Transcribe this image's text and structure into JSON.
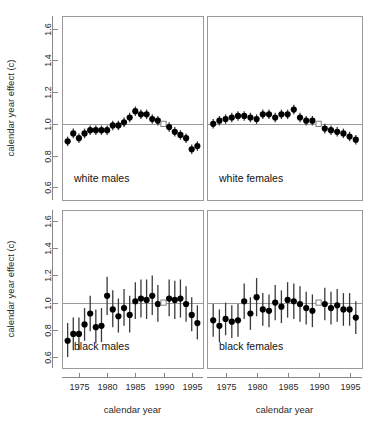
{
  "figure": {
    "title": "",
    "x_axis_title": "calendar year",
    "y_axis_title": "calendar year effect (c)"
  },
  "axes": {
    "x_ticks": [
      "1975",
      "1980",
      "1985",
      "1990",
      "1995"
    ],
    "x_tick_values": [
      1975,
      1980,
      1985,
      1990,
      1995
    ],
    "y_ticks": [
      "0.6",
      "0.8",
      "1.0",
      "1.2",
      "1.4",
      "1.6"
    ],
    "y_tick_values": [
      0.6,
      0.8,
      1.0,
      1.2,
      1.4,
      1.6
    ],
    "xlim": [
      1972.0,
      1997.0
    ],
    "ylim": [
      0.52,
      1.68
    ],
    "reference_value": 1.0,
    "reference_year": 1990
  },
  "chart_data": {
    "type": "scatter",
    "title": "",
    "xlabel": "calendar year",
    "ylabel": "calendar year effect (c)",
    "xlim": [
      1972.0,
      1997.0
    ],
    "ylim": [
      0.52,
      1.68
    ],
    "grid": false,
    "legend": "none",
    "layout": "2x2 panels, shared axes",
    "marker": "filled circle with vertical 95% confidence interval bars; open square marks the reference year (1990, c = 1.00)",
    "annotations": [
      "horizontal reference line drawn at c = 1.0 in every panel",
      "panel name printed inside lower-left of each panel"
    ],
    "panels": [
      {
        "name": "white males",
        "row": 0,
        "col": 0,
        "x": [
          1973,
          1974,
          1975,
          1976,
          1977,
          1978,
          1979,
          1980,
          1981,
          1982,
          1983,
          1984,
          1985,
          1986,
          1987,
          1988,
          1989,
          1990,
          1991,
          1992,
          1993,
          1994,
          1995,
          1996
        ],
        "y": [
          0.89,
          0.94,
          0.91,
          0.94,
          0.96,
          0.96,
          0.96,
          0.96,
          0.99,
          0.99,
          1.01,
          1.04,
          1.08,
          1.06,
          1.06,
          1.03,
          1.02,
          1.0,
          0.98,
          0.95,
          0.93,
          0.91,
          0.84,
          0.86
        ],
        "y_lower": [
          0.86,
          0.91,
          0.88,
          0.91,
          0.93,
          0.93,
          0.93,
          0.93,
          0.96,
          0.96,
          0.98,
          1.01,
          1.05,
          1.03,
          1.03,
          1.0,
          0.99,
          1.0,
          0.95,
          0.92,
          0.9,
          0.88,
          0.81,
          0.83
        ],
        "y_upper": [
          0.92,
          0.97,
          0.94,
          0.97,
          0.99,
          0.99,
          0.99,
          0.99,
          1.02,
          1.02,
          1.04,
          1.07,
          1.11,
          1.09,
          1.09,
          1.06,
          1.05,
          1.0,
          1.01,
          0.98,
          0.96,
          0.94,
          0.87,
          0.89
        ]
      },
      {
        "name": "white females",
        "row": 0,
        "col": 1,
        "x": [
          1973,
          1974,
          1975,
          1976,
          1977,
          1978,
          1979,
          1980,
          1981,
          1982,
          1983,
          1984,
          1985,
          1986,
          1987,
          1988,
          1989,
          1990,
          1991,
          1992,
          1993,
          1994,
          1995,
          1996
        ],
        "y": [
          1.0,
          1.02,
          1.03,
          1.04,
          1.05,
          1.05,
          1.04,
          1.03,
          1.06,
          1.06,
          1.04,
          1.06,
          1.06,
          1.09,
          1.04,
          1.02,
          1.02,
          1.0,
          0.97,
          0.96,
          0.95,
          0.94,
          0.92,
          0.9
        ],
        "y_lower": [
          0.97,
          0.99,
          1.0,
          1.01,
          1.02,
          1.02,
          1.01,
          1.0,
          1.03,
          1.03,
          1.01,
          1.03,
          1.03,
          1.06,
          1.01,
          0.99,
          0.99,
          1.0,
          0.94,
          0.93,
          0.92,
          0.91,
          0.89,
          0.87
        ],
        "y_upper": [
          1.03,
          1.05,
          1.06,
          1.07,
          1.08,
          1.08,
          1.07,
          1.06,
          1.09,
          1.09,
          1.07,
          1.09,
          1.09,
          1.12,
          1.07,
          1.05,
          1.05,
          1.0,
          1.0,
          0.99,
          0.98,
          0.97,
          0.95,
          0.93
        ]
      },
      {
        "name": "black males",
        "row": 1,
        "col": 0,
        "x": [
          1973,
          1974,
          1975,
          1976,
          1977,
          1978,
          1979,
          1980,
          1981,
          1982,
          1983,
          1984,
          1985,
          1986,
          1987,
          1988,
          1989,
          1990,
          1991,
          1992,
          1993,
          1994,
          1995,
          1996
        ],
        "y": [
          0.72,
          0.77,
          0.77,
          0.84,
          0.92,
          0.82,
          0.83,
          1.05,
          0.95,
          0.9,
          0.96,
          0.91,
          1.01,
          1.03,
          1.02,
          1.05,
          0.99,
          1.0,
          1.03,
          1.02,
          1.03,
          0.99,
          0.91,
          0.85
        ],
        "y_lower": [
          0.6,
          0.65,
          0.65,
          0.72,
          0.79,
          0.7,
          0.71,
          0.91,
          0.82,
          0.78,
          0.83,
          0.78,
          0.88,
          0.89,
          0.88,
          0.91,
          0.86,
          1.0,
          0.9,
          0.88,
          0.89,
          0.86,
          0.79,
          0.73
        ],
        "y_upper": [
          0.85,
          0.89,
          0.89,
          0.96,
          1.05,
          0.95,
          0.96,
          1.19,
          1.09,
          1.03,
          1.1,
          1.05,
          1.15,
          1.17,
          1.17,
          1.2,
          1.13,
          1.0,
          1.17,
          1.16,
          1.17,
          1.12,
          1.04,
          0.98
        ]
      },
      {
        "name": "black females",
        "row": 1,
        "col": 1,
        "x": [
          1973,
          1974,
          1975,
          1976,
          1977,
          1978,
          1979,
          1980,
          1981,
          1982,
          1983,
          1984,
          1985,
          1986,
          1987,
          1988,
          1989,
          1990,
          1991,
          1992,
          1993,
          1994,
          1995,
          1996
        ],
        "y": [
          0.87,
          0.83,
          0.88,
          0.86,
          0.87,
          1.01,
          0.92,
          1.04,
          0.95,
          0.94,
          1.0,
          0.97,
          1.02,
          1.01,
          0.99,
          0.96,
          0.94,
          1.0,
          0.99,
          0.96,
          0.98,
          0.95,
          0.95,
          0.89
        ],
        "y_lower": [
          0.75,
          0.71,
          0.76,
          0.74,
          0.75,
          0.88,
          0.8,
          0.9,
          0.83,
          0.82,
          0.87,
          0.85,
          0.89,
          0.88,
          0.86,
          0.84,
          0.82,
          1.0,
          0.87,
          0.84,
          0.86,
          0.83,
          0.83,
          0.77
        ],
        "y_upper": [
          0.99,
          0.95,
          1.0,
          0.98,
          0.99,
          1.14,
          1.04,
          1.18,
          1.07,
          1.06,
          1.13,
          1.09,
          1.15,
          1.14,
          1.12,
          1.08,
          1.06,
          1.0,
          1.11,
          1.08,
          1.1,
          1.07,
          1.07,
          1.01
        ]
      }
    ]
  },
  "colors": {
    "point": "#000000",
    "error_bar": "#3a3a3a",
    "reference_line": "#9a9a9a",
    "panel_border": "#9a9a9a",
    "axis": "#888888",
    "text": "#2a2a2a",
    "background": "#ffffff"
  }
}
